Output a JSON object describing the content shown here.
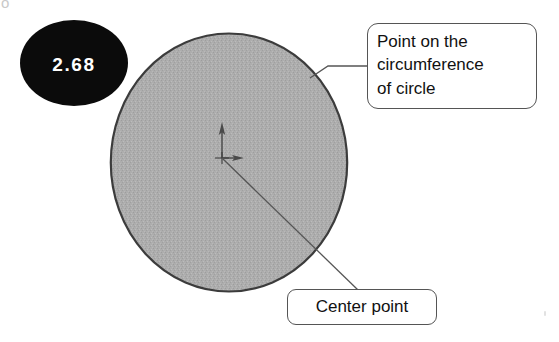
{
  "figure": {
    "background_color": "#ffffff"
  },
  "dimension_badge": {
    "value": "2.68",
    "fill_color": "#0b0b0b",
    "text_color": "#ffffff",
    "shape": "ellipse"
  },
  "circle": {
    "fill_color": "#a8a8a8",
    "outline_color": "#3a3a3a",
    "center_x": 229,
    "center_y": 163,
    "radius_x": 119,
    "radius_y": 130
  },
  "origin_marker": {
    "name": "coordinate-origin",
    "axis_color": "#4a4a4a",
    "vertical_axis": "y-axis-arrow-up",
    "horizontal_axis": "x-axis-arrow-right"
  },
  "callouts": [
    {
      "id": "circumference",
      "text": "Point on the circumference of circle",
      "lines": [
        "Point on the",
        "circumference",
        "of circle"
      ],
      "border_color": "#555555",
      "background_color": "#ffffff",
      "text_color": "#111111",
      "leader_target": "point-on-circle-edge"
    },
    {
      "id": "center",
      "text": "Center point",
      "lines": [
        "Center point"
      ],
      "border_color": "#555555",
      "background_color": "#ffffff",
      "text_color": "#111111",
      "leader_target": "circle-center-origin"
    }
  ],
  "artifacts": {
    "corner_mark": "o",
    "speck": "scan-speck"
  }
}
